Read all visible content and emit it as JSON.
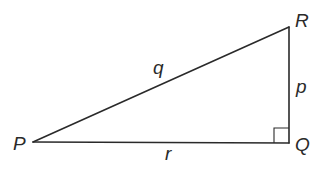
{
  "diagram": {
    "type": "right-triangle",
    "vertices": {
      "P": {
        "label": "P",
        "x": 33,
        "y": 142
      },
      "Q": {
        "label": "Q",
        "x": 289,
        "y": 143
      },
      "R": {
        "label": "R",
        "x": 289,
        "y": 27
      }
    },
    "sides": {
      "q": {
        "label": "q",
        "from": "P",
        "to": "R"
      },
      "p": {
        "label": "p",
        "from": "R",
        "to": "Q"
      },
      "r": {
        "label": "r",
        "from": "P",
        "to": "Q"
      }
    },
    "right_angle_at": "Q",
    "stroke_color": "#2a2a2a"
  }
}
